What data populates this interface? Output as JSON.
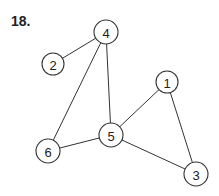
{
  "problem_label": "18.",
  "nodes": [
    {
      "id": "4",
      "x": 106,
      "y": 32,
      "r": 12
    },
    {
      "id": "2",
      "x": 53,
      "y": 64,
      "r": 11
    },
    {
      "id": "1",
      "x": 167,
      "y": 82,
      "r": 11
    },
    {
      "id": "5",
      "x": 111,
      "y": 135,
      "r": 12
    },
    {
      "id": "6",
      "x": 48,
      "y": 151,
      "r": 12
    },
    {
      "id": "3",
      "x": 196,
      "y": 174,
      "r": 12
    }
  ],
  "edges": [
    [
      "4",
      "2"
    ],
    [
      "4",
      "6"
    ],
    [
      "4",
      "5"
    ],
    [
      "1",
      "5"
    ],
    [
      "1",
      "3"
    ],
    [
      "5",
      "6"
    ],
    [
      "5",
      "3"
    ]
  ]
}
